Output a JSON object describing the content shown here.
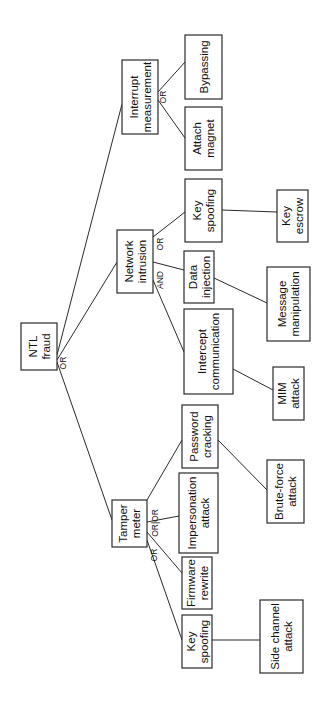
{
  "diagram": {
    "type": "attack-tree",
    "orientation": "rotated-90-ccw",
    "root": "NTL fraud",
    "nodes": [
      {
        "id": "ntl",
        "lines": [
          "NTL",
          "fraud"
        ],
        "x": 21,
        "y": 323,
        "w": 36,
        "h": 47
      },
      {
        "id": "interrupt",
        "lines": [
          "Interrupt",
          "measurement"
        ],
        "x": 122,
        "y": 60,
        "w": 36,
        "h": 74
      },
      {
        "id": "bypassing",
        "lines": [
          "Bypassing"
        ],
        "x": 185,
        "y": 35,
        "w": 37,
        "h": 64
      },
      {
        "id": "attach",
        "lines": [
          "Attach",
          "magnet"
        ],
        "x": 185,
        "y": 107,
        "w": 37,
        "h": 63
      },
      {
        "id": "network",
        "lines": [
          "Network",
          "intrusion"
        ],
        "x": 117,
        "y": 230,
        "w": 36,
        "h": 63
      },
      {
        "id": "keyspoof_net",
        "lines": [
          "Key",
          "spoofing"
        ],
        "x": 185,
        "y": 179,
        "w": 37,
        "h": 63
      },
      {
        "id": "keyescrow",
        "lines": [
          "Key",
          "escrow"
        ],
        "x": 277,
        "y": 190,
        "w": 31,
        "h": 52
      },
      {
        "id": "datainj",
        "lines": [
          "Data",
          "injection"
        ],
        "x": 184,
        "y": 251,
        "w": 30,
        "h": 52
      },
      {
        "id": "msgmanip",
        "lines": [
          "Message",
          "manipulation"
        ],
        "x": 267,
        "y": 267,
        "w": 43,
        "h": 74
      },
      {
        "id": "intercept",
        "lines": [
          "Intercept",
          "communication"
        ],
        "x": 184,
        "y": 309,
        "w": 49,
        "h": 85
      },
      {
        "id": "mim",
        "lines": [
          "MIM",
          "attack"
        ],
        "x": 273,
        "y": 367,
        "w": 31,
        "h": 53
      },
      {
        "id": "tamper",
        "lines": [
          "Tamper",
          "meter"
        ],
        "x": 112,
        "y": 500,
        "w": 35,
        "h": 47
      },
      {
        "id": "password",
        "lines": [
          "Password",
          "cracking"
        ],
        "x": 182,
        "y": 405,
        "w": 36,
        "h": 63
      },
      {
        "id": "bruteforce",
        "lines": [
          "Brute-force",
          "attack"
        ],
        "x": 267,
        "y": 460,
        "w": 37,
        "h": 63
      },
      {
        "id": "impersonation",
        "lines": [
          "Impersonation",
          "attack"
        ],
        "x": 179,
        "y": 473,
        "w": 39,
        "h": 80
      },
      {
        "id": "firmware",
        "lines": [
          "Firmware",
          "rewrite"
        ],
        "x": 182,
        "y": 557,
        "w": 30,
        "h": 52
      },
      {
        "id": "keyspoof_tamper",
        "lines": [
          "Key",
          "spoofing"
        ],
        "x": 182,
        "y": 615,
        "w": 30,
        "h": 53
      },
      {
        "id": "sidechannel",
        "lines": [
          "Side channel",
          "attack"
        ],
        "x": 260,
        "y": 600,
        "w": 43,
        "h": 73
      }
    ],
    "edges": [
      {
        "from": [
          57,
          355
        ],
        "to": [
          122,
          104
        ]
      },
      {
        "from": [
          57,
          360
        ],
        "to": [
          117,
          262
        ]
      },
      {
        "from": [
          57,
          362
        ],
        "to": [
          112,
          520
        ]
      },
      {
        "from": [
          158,
          92
        ],
        "to": [
          185,
          62
        ]
      },
      {
        "from": [
          158,
          100
        ],
        "to": [
          185,
          138
        ]
      },
      {
        "from": [
          153,
          237
        ],
        "to": [
          185,
          212
        ]
      },
      {
        "from": [
          222,
          210
        ],
        "to": [
          277,
          212
        ]
      },
      {
        "from": [
          153,
          262
        ],
        "to": [
          184,
          270
        ]
      },
      {
        "from": [
          214,
          278
        ],
        "to": [
          267,
          303
        ]
      },
      {
        "from": [
          153,
          280
        ],
        "to": [
          184,
          352
        ]
      },
      {
        "from": [
          233,
          369
        ],
        "to": [
          273,
          390
        ]
      },
      {
        "from": [
          147,
          500
        ],
        "to": [
          182,
          440
        ]
      },
      {
        "from": [
          218,
          440
        ],
        "to": [
          267,
          490
        ]
      },
      {
        "from": [
          147,
          522
        ],
        "to": [
          179,
          516
        ]
      },
      {
        "from": [
          147,
          532
        ],
        "to": [
          182,
          573
        ]
      },
      {
        "from": [
          147,
          540
        ],
        "to": [
          182,
          640
        ]
      },
      {
        "from": [
          212,
          640
        ],
        "to": [
          260,
          640
        ]
      }
    ],
    "gates": [
      {
        "label": "OR",
        "x": 66,
        "y": 363
      },
      {
        "label": "OR",
        "x": 166,
        "y": 97
      },
      {
        "label": "OR",
        "x": 163,
        "y": 244
      },
      {
        "label": "AND",
        "x": 163,
        "y": 280
      },
      {
        "label": "OR|OR",
        "x": 158,
        "y": 523
      },
      {
        "label": "OR",
        "x": 157,
        "y": 555
      }
    ]
  }
}
